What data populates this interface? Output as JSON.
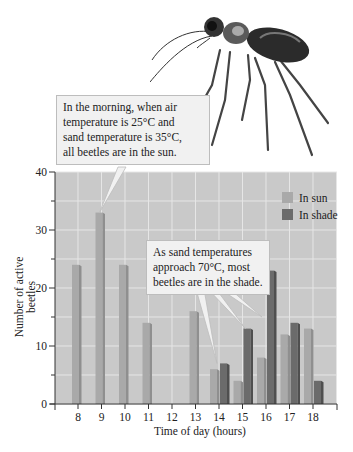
{
  "callouts": {
    "morning": {
      "lines": [
        "In the morning, when air",
        "temperature is 25°C and",
        "sand temperature is 35°C,",
        "all beetles are in the sun."
      ]
    },
    "afternoon": {
      "lines": [
        "As sand temperatures",
        "approach 70°C, most",
        "beetles are in the shade."
      ]
    }
  },
  "colors": {
    "plot_background": "#c9c9c9",
    "gridline": "#e6e6e6",
    "sun": "#a9a9a9",
    "sun_side": "#8f8f8f",
    "shade": "#6b6b6b",
    "shade_side": "#4f4f4f",
    "axis": "#333333"
  },
  "chart_data": {
    "type": "bar",
    "title": "",
    "xlabel": "Time of day (hours)",
    "ylabel": "Number of active beetles",
    "categories": [
      "8",
      "9",
      "10",
      "11",
      "12",
      "13",
      "14",
      "15",
      "16",
      "17",
      "18"
    ],
    "series": [
      {
        "name": "In sun",
        "values": [
          24,
          33,
          24,
          14,
          0,
          16,
          6,
          4,
          8,
          12,
          13
        ]
      },
      {
        "name": "In shade",
        "values": [
          0,
          0,
          0,
          0,
          0,
          0,
          7,
          13,
          23,
          14,
          4
        ]
      }
    ],
    "ylim": [
      0,
      40
    ],
    "yticks": [
      0,
      10,
      20,
      30,
      40
    ],
    "yminor_ticks": [
      5,
      15,
      25,
      35
    ],
    "grid": true,
    "legend_position": "upper right, inside plot"
  }
}
